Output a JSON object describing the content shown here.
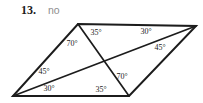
{
  "problem": {
    "number": "13.",
    "answer": "no"
  },
  "figure": {
    "type": "parallelogram-with-diagonals",
    "angle_labels": [
      {
        "text": "35°",
        "position": "top-left-vertex-between-top-edge-and-diagonal"
      },
      {
        "text": "70°",
        "position": "top-left-vertex-between-diagonal-and-left-side"
      },
      {
        "text": "30°",
        "position": "top-right-vertex-between-top-edge-and-diagonal"
      },
      {
        "text": "45°",
        "position": "top-right-vertex-between-diagonal-and-right-side"
      },
      {
        "text": "45°",
        "position": "bottom-left-vertex-between-left-side-and-diagonal"
      },
      {
        "text": "30°",
        "position": "bottom-left-vertex-between-diagonal-and-bottom-edge"
      },
      {
        "text": "70°",
        "position": "bottom-right-vertex-between-diagonal-and-right-side"
      },
      {
        "text": "35°",
        "position": "bottom-right-vertex-between-bottom-edge-and-diagonal"
      }
    ],
    "colors": {
      "line": "#1c1c1c",
      "label_text": "#222222",
      "problem_number": "#1b1b1b",
      "answer": "#8e8e8e",
      "background": "#ffffff"
    }
  }
}
